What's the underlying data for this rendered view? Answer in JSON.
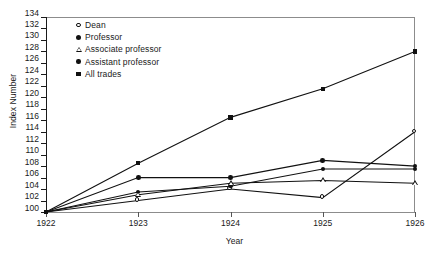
{
  "chart_data": {
    "type": "line",
    "title": "",
    "xlabel": "Year",
    "ylabel": "Index Number",
    "x": [
      1922,
      1923,
      1924,
      1925,
      1926
    ],
    "xtick_labels": [
      "1922",
      "1923",
      "1924",
      "1925",
      "1926"
    ],
    "ytick_labels": [
      "134",
      "132",
      "130",
      "128",
      "126",
      "124",
      "122",
      "120",
      "118",
      "116",
      "114",
      "112",
      "110",
      "108",
      "106",
      "104",
      "102",
      "100"
    ],
    "ylim": [
      100,
      134
    ],
    "ytick_step": 2,
    "xlim": [
      1922,
      1926
    ],
    "grid": false,
    "legend_position": "top-left-inside",
    "series": [
      {
        "name": "Dean",
        "marker": "open-circle",
        "values": [
          100,
          102,
          104,
          102.5,
          114
        ]
      },
      {
        "name": "Professor",
        "marker": "filled-circle",
        "values": [
          100,
          106,
          106,
          109,
          108
        ]
      },
      {
        "name": "Associate professor",
        "marker": "triangle",
        "values": [
          100,
          103,
          105,
          105.5,
          105
        ]
      },
      {
        "name": "Assistant professor",
        "marker": "filled-circle-b",
        "values": [
          100,
          103.5,
          104.5,
          107.5,
          107.5
        ]
      },
      {
        "name": "All trades",
        "marker": "square",
        "values": [
          100,
          108.5,
          116.5,
          121.5,
          128
        ]
      }
    ]
  },
  "legend": {
    "items": [
      {
        "label": "Dean",
        "marker": "open-circle"
      },
      {
        "label": "Professor",
        "marker": "filled-circle"
      },
      {
        "label": "Associate professor",
        "marker": "triangle"
      },
      {
        "label": "Assistant professor",
        "marker": "filled-circle-b"
      },
      {
        "label": "All trades",
        "marker": "square"
      }
    ]
  }
}
